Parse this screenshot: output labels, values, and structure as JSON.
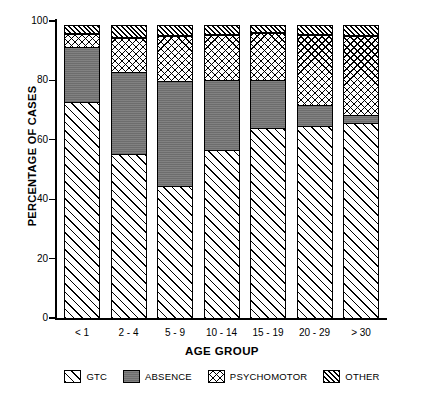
{
  "chart_data": {
    "type": "bar",
    "subtype": "stacked-bar-100",
    "title": "",
    "xlabel": "AGE GROUP",
    "ylabel": "PERCENTAGE OF CASES",
    "ylim": [
      0,
      100
    ],
    "yticks": [
      0,
      20,
      40,
      60,
      80,
      100
    ],
    "ytick_labels": [
      "0",
      "20",
      "40",
      "60",
      "80",
      "100"
    ],
    "grid": false,
    "legend_position": "bottom",
    "categories": [
      "< 1",
      "2 - 4",
      "5 - 9",
      "10 - 14",
      "15 - 19",
      "20 - 29",
      "> 30"
    ],
    "series": [
      {
        "name": "GTC",
        "pattern": "diagonal-hatch",
        "values": [
          73.0,
          55.5,
          45.0,
          57.0,
          64.5,
          65.0,
          66.0
        ]
      },
      {
        "name": "ABSENCE",
        "pattern": "solid-gray",
        "values": [
          19.0,
          28.0,
          35.5,
          24.0,
          16.5,
          7.5,
          3.0
        ]
      },
      {
        "name": "PSYCHOMOTOR",
        "pattern": "cross-hatch",
        "values": [
          5.0,
          12.0,
          15.5,
          15.5,
          16.0,
          24.0,
          27.0
        ]
      },
      {
        "name": "OTHER",
        "pattern": "dense-diagonal-hatch",
        "values": [
          3.0,
          4.5,
          4.0,
          3.5,
          3.0,
          3.5,
          4.0
        ]
      }
    ],
    "cumulative_tops": {
      "GTC": [
        73.0,
        55.5,
        45.0,
        57.0,
        64.5,
        65.0,
        66.0
      ],
      "ABSENCE": [
        92.0,
        83.5,
        80.5,
        81.0,
        81.0,
        72.5,
        69.0
      ],
      "PSYCHOMOTOR": [
        97.0,
        95.5,
        96.0,
        96.5,
        97.0,
        96.5,
        96.0
      ],
      "OTHER": [
        100.0,
        100.0,
        100.0,
        100.0,
        100.0,
        100.0,
        100.0
      ]
    }
  },
  "axes": {
    "y_title": "PERCENTAGE OF CASES",
    "x_title": "AGE GROUP",
    "y_ticks": [
      {
        "value": 100,
        "label": "100"
      },
      {
        "value": 80,
        "label": "80"
      },
      {
        "value": 60,
        "label": "60"
      },
      {
        "value": 40,
        "label": "40"
      },
      {
        "value": 20,
        "label": "20"
      },
      {
        "value": 0,
        "label": "0"
      }
    ]
  },
  "legend": {
    "items": [
      {
        "label": "GTC",
        "key": "gtc"
      },
      {
        "label": "ABSENCE",
        "key": "absence"
      },
      {
        "label": "PSYCHOMOTOR",
        "key": "psychomotor"
      },
      {
        "label": "OTHER",
        "key": "other"
      }
    ]
  },
  "colors": {
    "background": "#ffffff",
    "foreground": "#000000",
    "absence_fill": "#6d6d6d"
  }
}
